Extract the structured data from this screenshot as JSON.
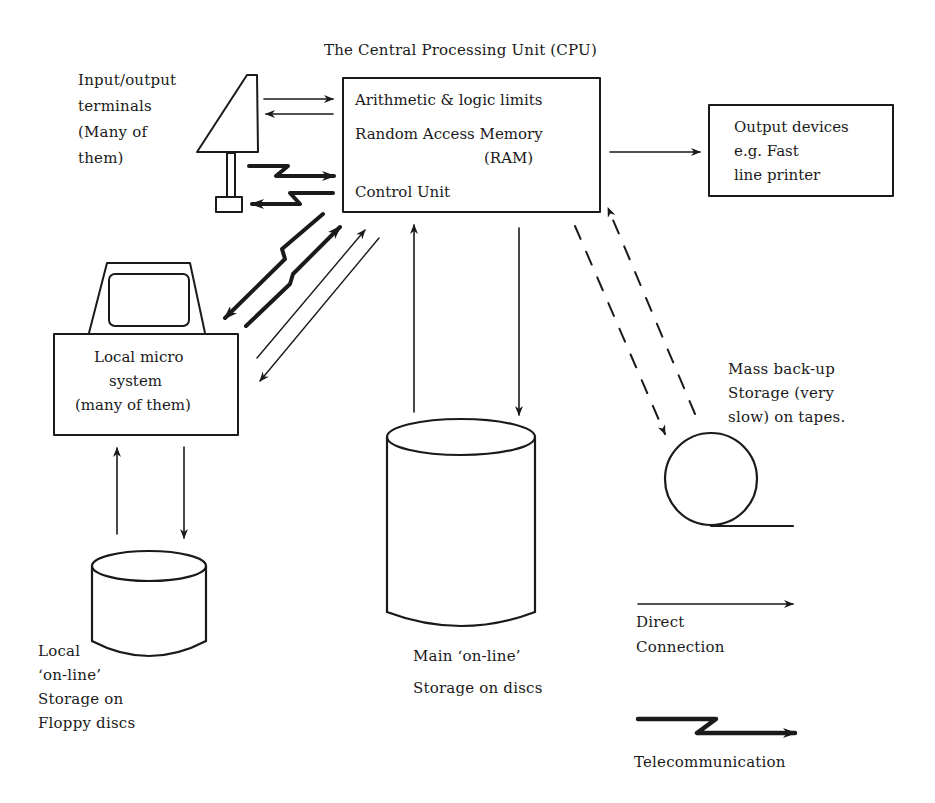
{
  "title": "The Central Processing Unit (CPU)",
  "cpu": {
    "lines": [
      "Arithmetic & logic limits",
      "Random Access Memory",
      "(RAM)",
      "Control Unit"
    ]
  },
  "terminals": {
    "lines": [
      "Input/output",
      "terminals",
      "(Many of",
      "them)"
    ]
  },
  "output_devices": {
    "lines": [
      "Output devices",
      "e.g. Fast",
      "line printer"
    ]
  },
  "local_micro": {
    "lines": [
      "Local micro",
      "system",
      "(many of them)"
    ]
  },
  "mass_backup": {
    "lines": [
      "Mass back-up",
      "Storage (very",
      "slow) on tapes."
    ]
  },
  "local_storage": {
    "lines": [
      "Local",
      "‘on-line’",
      "Storage on",
      "Floppy discs"
    ]
  },
  "main_storage": {
    "lines": [
      "Main ‘on-line’",
      "Storage on discs"
    ]
  },
  "legend": {
    "direct": [
      "Direct",
      "Connection"
    ],
    "telecom": "Telecommunication"
  },
  "colors": {
    "ink": "#1a1a1a",
    "paper": "#ffffff"
  }
}
